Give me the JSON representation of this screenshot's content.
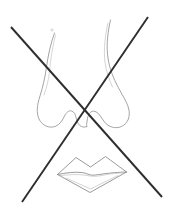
{
  "image": {
    "title": "Crossed-out pencil sketch of a nose and lips",
    "width": 175,
    "height": 212,
    "background_color": "#ffffff",
    "medium": "graphite pencil line drawing, scanned on white paper",
    "description": "A faint light-grey pencil line drawing of a human nose in the upper portion and a pair of lips in the lower portion, with a large dark X drawn across the entire sheet cancelling the drawing."
  },
  "colors": {
    "paper": "#ffffff",
    "pencil_light": "#9a9a9a",
    "pencil_mid": "#8a8a8a",
    "pencil_faint": "#b4b4b4",
    "cross_dark": "#2e2d2c",
    "dot_mark": "#c9c9c9"
  },
  "strokes": {
    "nose_left_label": "nose-left-contour",
    "nose_right_label": "nose-right-contour",
    "nose_tip_label": "nose-tip-and-nostrils",
    "lips_upper_label": "upper-lip-outline",
    "lips_lower_label": "lower-lip-outline",
    "lips_mouth_line_label": "mouth-parting-line",
    "cross_a_label": "cross-stroke-top-left-to-bottom-right",
    "cross_b_label": "cross-stroke-top-right-to-bottom-left",
    "stray_dot_label": "stray-pencil-dot"
  },
  "geometry": {
    "cross_a": {
      "x1": 11,
      "y1": 27,
      "x2": 162,
      "y2": 197
    },
    "cross_b": {
      "x1": 148,
      "y1": 17,
      "x2": 22,
      "y2": 202
    },
    "cross_intersection": {
      "x": 88,
      "y": 116
    },
    "cross_stroke_width": 1.9,
    "sketch_stroke_width": 0.9,
    "stray_dot": {
      "x": 52,
      "y": 30,
      "r": 1.1
    }
  },
  "elements": {
    "nose": {
      "name": "nose",
      "region": "upper",
      "bbox": {
        "x": 36,
        "y": 18,
        "width": 96,
        "height": 116
      }
    },
    "lips": {
      "name": "lips",
      "region": "lower",
      "bbox": {
        "x": 55,
        "y": 152,
        "width": 72,
        "height": 42
      }
    },
    "cross": {
      "name": "cancellation-x",
      "region": "full-page",
      "bbox": {
        "x": 11,
        "y": 17,
        "width": 151,
        "height": 185
      }
    }
  }
}
